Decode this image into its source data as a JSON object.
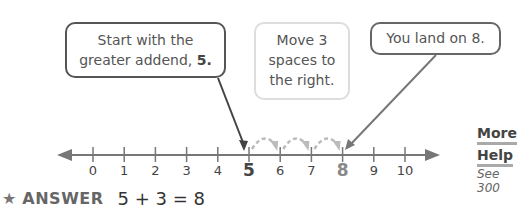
{
  "callouts": [
    {
      "id": "start",
      "line1": "Start with the",
      "line2_prefix": "greater addend, ",
      "line2_bold": "5."
    },
    {
      "id": "move",
      "line1": "Move 3",
      "line2": "spaces to",
      "line3": "the right."
    },
    {
      "id": "land",
      "text": "You land on 8."
    }
  ],
  "number_line": {
    "min": 0,
    "max": 10,
    "labels": [
      "0",
      "1",
      "2",
      "3",
      "4",
      "5",
      "6",
      "7",
      "8",
      "9",
      "10"
    ],
    "start_value": 5,
    "end_value": 8,
    "jumps": 3,
    "line_color": "#777777",
    "jump_color": "#bbbbbb"
  },
  "more_help": {
    "title_line1": "More",
    "title_line2": "Help",
    "see_label": "See",
    "page": "300"
  },
  "answer": {
    "star_icon": "★",
    "label": "ANSWER",
    "equation": "5 + 3 = 8"
  }
}
